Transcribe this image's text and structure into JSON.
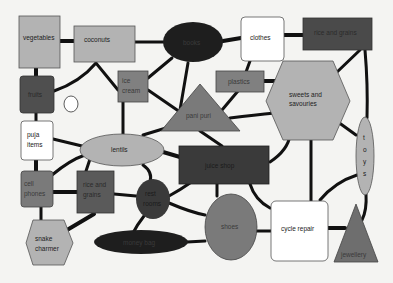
{
  "diagram": {
    "title": "",
    "colors": {
      "background": "#f4f4f2",
      "light_gray": "#b3b3b3",
      "mid_gray": "#8a8a8a",
      "dark_gray": "#5a5a5a",
      "very_dark": "#2a2a2a",
      "black_fill": "#1e1e1e",
      "white": "#ffffff",
      "edge": "#111111"
    },
    "nodes": {
      "vegetables": {
        "label": "vegetables",
        "shape": "rect"
      },
      "coconuts": {
        "label": "coconuts",
        "shape": "rect"
      },
      "books": {
        "label": "books",
        "shape": "ellipse"
      },
      "clothes": {
        "label": "clothes",
        "shape": "rounded-rect"
      },
      "rice_grains_top": {
        "label": "rice and grains",
        "shape": "rect"
      },
      "fruits": {
        "label": "fruits",
        "shape": "rounded-rect"
      },
      "empty_circle": {
        "label": "",
        "shape": "ellipse"
      },
      "ice_cream": {
        "label_line1": "ice",
        "label_line2": "cream",
        "shape": "rect"
      },
      "plastics": {
        "label": "plastics",
        "shape": "rect"
      },
      "pani_puri": {
        "label": "pani puri",
        "shape": "triangle"
      },
      "sweets": {
        "label_line1": "sweets and",
        "label_line2": "savouries",
        "shape": "hexagon"
      },
      "puja_items": {
        "label_line1": "puja",
        "label_line2": "items",
        "shape": "rounded-rect"
      },
      "lentils": {
        "label": "lentils",
        "shape": "ellipse"
      },
      "juice_shop": {
        "label": "juice shop",
        "shape": "rect"
      },
      "toys": {
        "label": "t o y s",
        "letters": [
          "t",
          "o",
          "y",
          "s"
        ],
        "shape": "ellipse"
      },
      "cell_phones": {
        "label_line1": "cell",
        "label_line2": "phones",
        "shape": "rounded-rect"
      },
      "rice_grains_mid": {
        "label_line1": "rice and",
        "label_line2": "grains",
        "shape": "rect"
      },
      "rest_rooms": {
        "label_line1": "rest",
        "label_line2": "rooms",
        "shape": "ellipse"
      },
      "shoes": {
        "label": "shoes",
        "shape": "ellipse"
      },
      "cycle_repair": {
        "label": "cycle repair",
        "shape": "rounded-rect"
      },
      "snake_charmer": {
        "label_line1": "snake",
        "label_line2": "charmer",
        "shape": "hexagon"
      },
      "money_bag": {
        "label": "money bag",
        "shape": "ellipse"
      },
      "jewellery": {
        "label": "jewellery",
        "shape": "triangle"
      }
    }
  }
}
